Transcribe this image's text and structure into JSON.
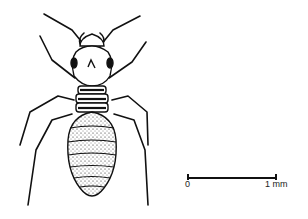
{
  "figure": {
    "style": "black ink line drawing with stippled abdomen",
    "line_color": "#111111",
    "background": "#ffffff"
  },
  "scale_bar": {
    "start_label": "0",
    "end_label": "1 mm"
  }
}
